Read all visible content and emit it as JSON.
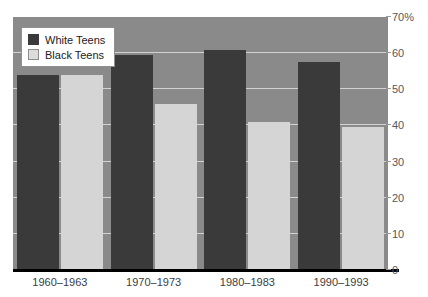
{
  "chart_data": {
    "type": "bar",
    "title": "",
    "xlabel": "",
    "ylabel": "",
    "ylim": [
      0,
      70
    ],
    "grid": true,
    "legend_position": "top-left",
    "categories": [
      "1960–1963",
      "1970–1973",
      "1980–1983",
      "1990–1993"
    ],
    "ytick_labels": [
      "0",
      "10",
      "20",
      "30",
      "40",
      "50",
      "60",
      "70%"
    ],
    "ytick_values": [
      0,
      10,
      20,
      30,
      40,
      50,
      60,
      70
    ],
    "series": [
      {
        "name": "White Teens",
        "color": "#3a3a3a",
        "values": [
          54,
          59.5,
          61,
          57.5
        ]
      },
      {
        "name": "Black Teens",
        "color": "#d5d5d5",
        "values": [
          54,
          46,
          41,
          39.5
        ]
      }
    ]
  },
  "legend": {
    "items": [
      {
        "label": "White Teens",
        "swatch": "white-teens"
      },
      {
        "label": "Black Teens",
        "swatch": "black-teens"
      }
    ]
  },
  "colors": {
    "plot_background": "#8a8a8a",
    "gridline": "#d2d2d2",
    "axis": "#000000",
    "white_teens": "#3a3a3a",
    "black_teens": "#d5d5d5"
  }
}
